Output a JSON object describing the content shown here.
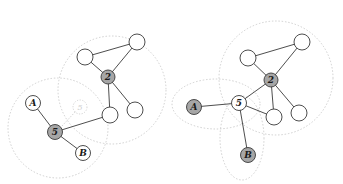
{
  "diagram": {
    "left": {
      "labels": {
        "node_2": "2",
        "node_5": "5",
        "node_a": "A",
        "node_b": "B",
        "ghost_5": "5"
      }
    },
    "right": {
      "labels": {
        "node_2": "2",
        "node_5": "5",
        "node_a": "A",
        "node_b": "B"
      }
    },
    "colors": {
      "highlight_node": "#a6a6a6",
      "plain_node": "#ffffff",
      "stroke": "#3a3a3a",
      "halo": "#c4c4c4"
    }
  }
}
